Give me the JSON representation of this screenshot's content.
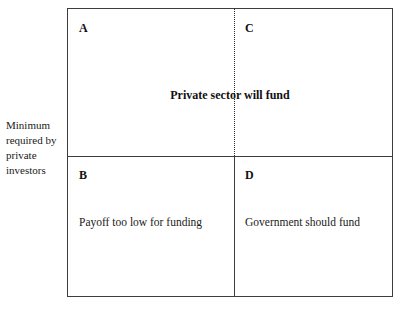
{
  "figure": {
    "type": "two-by-two-matrix",
    "axis_caption": "Minimum required by private investors",
    "top_banner": "Private sector will fund",
    "quadrants": [
      {
        "id": "A",
        "letter": "A",
        "position": "top-left",
        "caption": ""
      },
      {
        "id": "C",
        "letter": "C",
        "position": "top-right",
        "caption": ""
      },
      {
        "id": "B",
        "letter": "B",
        "position": "bottom-left",
        "caption": "Payoff too low for funding"
      },
      {
        "id": "D",
        "letter": "D",
        "position": "bottom-right",
        "caption": "Government should fund"
      }
    ],
    "colors": {
      "border": "#3d3d3d",
      "divider_dotted": "#2b2b2b",
      "text": "#1a1a1a",
      "background": "#ffffff"
    }
  }
}
